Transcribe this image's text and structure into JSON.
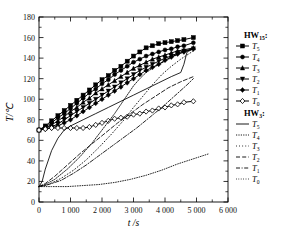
{
  "chart_data": {
    "type": "line",
    "title": "",
    "xlabel": "t /s",
    "ylabel": "T/℃",
    "xlim": [
      0,
      6000
    ],
    "ylim": [
      0,
      180
    ],
    "xticks": [
      0,
      1000,
      2000,
      3000,
      4000,
      5000,
      6000
    ],
    "xticklabels": [
      "0",
      "1 000",
      "2 000",
      "3 000",
      "4 000",
      "5 000",
      "6 000"
    ],
    "yticks": [
      0,
      20,
      40,
      60,
      80,
      100,
      120,
      140,
      160,
      180
    ],
    "yticklabels": [
      "0",
      "20",
      "40",
      "60",
      "80",
      "100",
      "120",
      "140",
      "160",
      "180"
    ],
    "minor_ticks": true,
    "grid": false,
    "legend_position": "right-outside",
    "legend_groups": [
      {
        "heading": "HW",
        "heading_sub": "15",
        "heading_suffix": ":",
        "entries": [
          {
            "label": "T",
            "sub": "5",
            "style": "solid-marker",
            "marker": "square"
          },
          {
            "label": "T",
            "sub": "4",
            "style": "solid-marker",
            "marker": "circle"
          },
          {
            "label": "T",
            "sub": "3",
            "style": "solid-marker",
            "marker": "triangle-up"
          },
          {
            "label": "T",
            "sub": "2",
            "style": "solid-marker",
            "marker": "triangle-down"
          },
          {
            "label": "T",
            "sub": "1",
            "style": "solid-marker",
            "marker": "diamond"
          },
          {
            "label": "T",
            "sub": "0",
            "style": "solid-marker",
            "marker": "diamond-open"
          }
        ]
      },
      {
        "heading": "HW",
        "heading_sub": "3",
        "heading_suffix": ":",
        "entries": [
          {
            "label": "T",
            "sub": "5",
            "style": "solid"
          },
          {
            "label": "T",
            "sub": "4",
            "style": "dotted-dense"
          },
          {
            "label": "T",
            "sub": "3",
            "style": "dotted-sparse"
          },
          {
            "label": "T",
            "sub": "2",
            "style": "dashed"
          },
          {
            "label": "T",
            "sub": "1",
            "style": "dash-dot"
          },
          {
            "label": "T",
            "sub": "0",
            "style": "dotted-fine"
          }
        ]
      }
    ],
    "series": [
      {
        "name": "HW15 T5",
        "group": "HW15",
        "style": "solid-marker",
        "marker": "square",
        "x": [
          0,
          200,
          400,
          600,
          800,
          1000,
          1200,
          1400,
          1600,
          1800,
          2000,
          2200,
          2400,
          2600,
          2800,
          3000,
          3200,
          3400,
          3600,
          3800,
          4000,
          4200,
          4400,
          4600,
          4900
        ],
        "y": [
          70,
          74,
          79,
          84,
          89,
          94,
          99,
          104,
          109,
          114,
          119,
          123,
          128,
          132,
          137,
          142,
          146,
          150,
          152,
          154,
          155,
          156,
          157,
          158,
          160
        ]
      },
      {
        "name": "HW15 T4",
        "group": "HW15",
        "style": "solid-marker",
        "marker": "circle",
        "x": [
          0,
          200,
          400,
          600,
          800,
          1000,
          1200,
          1400,
          1600,
          1800,
          2000,
          2200,
          2400,
          2600,
          2800,
          3000,
          3200,
          3400,
          3600,
          3800,
          4000,
          4200,
          4400,
          4600,
          4900
        ],
        "y": [
          70,
          73,
          77,
          82,
          86,
          91,
          96,
          101,
          106,
          110,
          115,
          119,
          124,
          128,
          132,
          136,
          139,
          142,
          144,
          146,
          148,
          149,
          151,
          152,
          155
        ]
      },
      {
        "name": "HW15 T3",
        "group": "HW15",
        "style": "solid-marker",
        "marker": "triangle-up",
        "x": [
          0,
          200,
          400,
          600,
          800,
          1000,
          1200,
          1400,
          1600,
          1800,
          2000,
          2200,
          2400,
          2600,
          2800,
          3000,
          3200,
          3400,
          3600,
          3800,
          4000,
          4200,
          4400,
          4600,
          4900
        ],
        "y": [
          70,
          72,
          75,
          79,
          83,
          88,
          92,
          97,
          101,
          106,
          110,
          114,
          118,
          122,
          126,
          130,
          133,
          136,
          139,
          141,
          143,
          145,
          147,
          148,
          150
        ]
      },
      {
        "name": "HW15 T2",
        "group": "HW15",
        "style": "solid-marker",
        "marker": "triangle-down",
        "x": [
          0,
          200,
          400,
          600,
          800,
          1000,
          1200,
          1400,
          1600,
          1800,
          2000,
          2200,
          2400,
          2600,
          2800,
          3000,
          3200,
          3400,
          3600,
          3800,
          4000,
          4200,
          4400,
          4600,
          4900
        ],
        "y": [
          70,
          71,
          73,
          76,
          80,
          84,
          88,
          92,
          96,
          100,
          104,
          108,
          112,
          116,
          120,
          124,
          128,
          131,
          134,
          137,
          140,
          142,
          145,
          147,
          149
        ]
      },
      {
        "name": "HW15 T1",
        "group": "HW15",
        "style": "solid-marker",
        "marker": "diamond",
        "x": [
          0,
          200,
          400,
          600,
          800,
          1000,
          1200,
          1400,
          1600,
          1800,
          2000,
          2200,
          2400,
          2600,
          2800,
          3000,
          3200,
          3400,
          3600,
          3800,
          4000,
          4200,
          4400,
          4600,
          4900
        ],
        "y": [
          70,
          71,
          72,
          74,
          77,
          80,
          84,
          88,
          92,
          96,
          100,
          104,
          108,
          112,
          116,
          120,
          124,
          128,
          131,
          134,
          138,
          141,
          144,
          146,
          149
        ]
      },
      {
        "name": "HW15 T0",
        "group": "HW15",
        "style": "solid-marker",
        "marker": "diamond-open",
        "x": [
          0,
          200,
          400,
          600,
          800,
          1000,
          1200,
          1400,
          1600,
          1800,
          2000,
          2200,
          2400,
          2600,
          2800,
          3000,
          3200,
          3400,
          3600,
          3800,
          4000,
          4200,
          4400,
          4600,
          4900
        ],
        "y": [
          70,
          71,
          72,
          72,
          72,
          72,
          72,
          72,
          73,
          75,
          77,
          79,
          81,
          82,
          83,
          85,
          86,
          88,
          89,
          91,
          92,
          94,
          95,
          97,
          98
        ]
      },
      {
        "name": "HW3 T5",
        "group": "HW3",
        "style": "solid",
        "x": [
          0,
          100,
          200,
          400,
          600,
          800,
          1000,
          1400,
          1800,
          2200,
          2600,
          3000,
          3400,
          3800,
          4200,
          4500,
          4600,
          4700,
          4900
        ],
        "y": [
          15,
          20,
          32,
          50,
          62,
          70,
          74,
          80,
          86,
          92,
          98,
          104,
          110,
          116,
          122,
          126,
          134,
          146,
          149
        ]
      },
      {
        "name": "HW3 T4",
        "group": "HW3",
        "style": "dotted-dense",
        "x": [
          0,
          200,
          500,
          900,
          1300,
          1700,
          2100,
          2400,
          2600,
          2800,
          3000,
          3200,
          3400,
          3700,
          4000,
          4300,
          4600,
          4900
        ],
        "y": [
          15,
          17,
          22,
          32,
          44,
          58,
          74,
          86,
          95,
          104,
          113,
          120,
          126,
          132,
          137,
          142,
          146,
          149
        ]
      },
      {
        "name": "HW3 T3",
        "group": "HW3",
        "style": "dotted-sparse",
        "x": [
          0,
          300,
          700,
          1100,
          1500,
          1900,
          2300,
          2700,
          3000,
          3300,
          3600,
          3900,
          4200,
          4500,
          4900
        ],
        "y": [
          15,
          17,
          23,
          31,
          41,
          53,
          66,
          80,
          92,
          103,
          114,
          124,
          132,
          139,
          147
        ]
      },
      {
        "name": "HW3 T2",
        "group": "HW3",
        "style": "dashed",
        "x": [
          0,
          200,
          500,
          900,
          1300,
          1700,
          2100,
          2500,
          2900,
          3300,
          3700,
          4100,
          4500,
          4900
        ],
        "y": [
          15,
          18,
          25,
          36,
          47,
          57,
          67,
          77,
          86,
          95,
          103,
          111,
          117,
          122
        ]
      },
      {
        "name": "HW3 T1",
        "group": "HW3",
        "style": "dash-dot",
        "x": [
          0,
          300,
          700,
          1100,
          1500,
          1900,
          2300,
          2700,
          3100,
          3500,
          3900,
          4300,
          4700,
          4900
        ],
        "y": [
          15,
          17,
          21,
          28,
          36,
          45,
          54,
          63,
          72,
          82,
          92,
          103,
          114,
          120
        ]
      },
      {
        "name": "HW3 T0",
        "group": "HW3",
        "style": "dotted-fine",
        "x": [
          0,
          400,
          900,
          1400,
          1900,
          2400,
          2900,
          3400,
          3900,
          4400,
          4900,
          5400
        ],
        "y": [
          15,
          15,
          15,
          16,
          17,
          19,
          22,
          26,
          31,
          37,
          42,
          47
        ]
      }
    ]
  }
}
